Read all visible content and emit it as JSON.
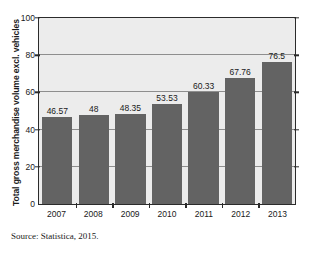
{
  "top_clipped_text": "",
  "source_note": "Source: Statistica, 2015.",
  "chart_data": {
    "type": "bar",
    "title": "",
    "xlabel": "",
    "ylabel": "Total gross merchandise volume excl. vehicles",
    "categories": [
      "2007",
      "2008",
      "2009",
      "2010",
      "2011",
      "2012",
      "2013"
    ],
    "values": [
      46.57,
      48,
      48.35,
      53.53,
      60.33,
      67.76,
      76.5
    ],
    "value_labels": [
      "46.57",
      "48",
      "48.35",
      "53.53",
      "60.33",
      "67.76",
      "76.5"
    ],
    "ylim": [
      0,
      100
    ],
    "yticks": [
      0,
      20,
      40,
      60,
      80,
      100
    ],
    "ytick_labels": [
      "0",
      "20",
      "40",
      "60",
      "80",
      "100"
    ],
    "gridlines": [
      20,
      40,
      60,
      80
    ],
    "grid": true,
    "legend": null,
    "bar_color": "#636363",
    "plot_background": "#ececec",
    "axis_color": "#2b2b2b",
    "gridline_color": "#8e8e8e"
  }
}
